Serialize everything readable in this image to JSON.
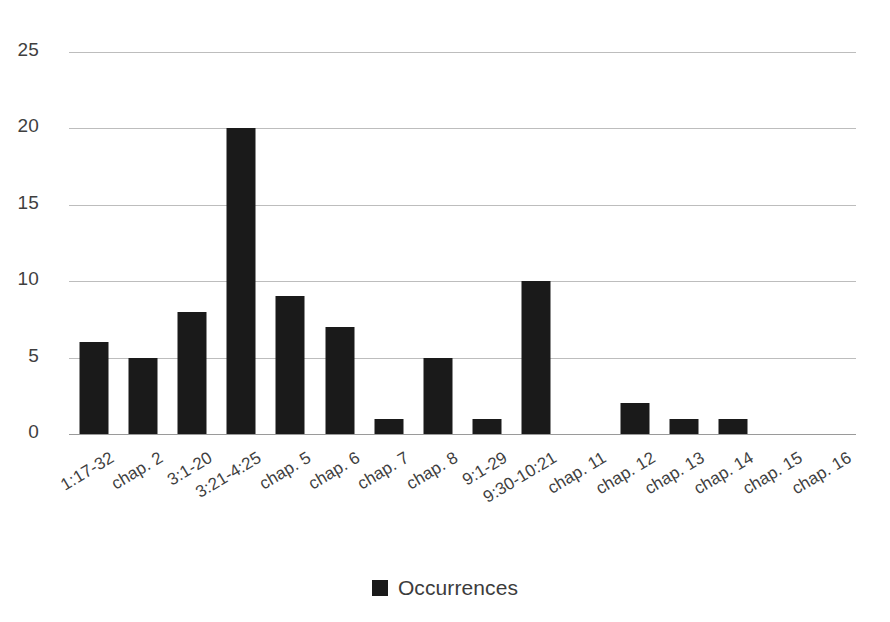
{
  "chart_data": {
    "type": "bar",
    "title": "",
    "subtitle": "",
    "xlabel": "",
    "ylabel": "",
    "ylim": [
      0,
      25
    ],
    "yticks": [
      0,
      5,
      10,
      15,
      20,
      25
    ],
    "grid": true,
    "legend_position": "bottom",
    "bar_color": "#1a1a1a",
    "gridline_color": "#bdbdbd",
    "text_color": "#3f3f3f",
    "background_color": "#ffffff",
    "categories": [
      "1:17-32",
      "chap. 2",
      "3:1-20",
      "3:21-4:25",
      "chap. 5",
      "chap. 6",
      "chap. 7",
      "chap. 8",
      "9:1-29",
      "9:30-10:21",
      "chap. 11",
      "chap. 12",
      "chap. 13",
      "chap. 14",
      "chap. 15",
      "chap. 16"
    ],
    "series": [
      {
        "name": "Occurrences",
        "values": [
          6,
          5,
          8,
          20,
          9,
          7,
          1,
          5,
          1,
          10,
          0,
          2,
          1,
          1,
          0,
          0
        ]
      }
    ]
  },
  "legend": {
    "items": [
      {
        "label": "Occurrences",
        "color": "#1a1a1a",
        "marker": "square-marker"
      }
    ]
  }
}
